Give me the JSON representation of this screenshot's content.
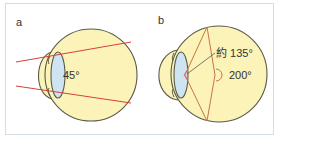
{
  "figure": {
    "panels": [
      {
        "id": "a",
        "label": "a",
        "angle_label": "45°"
      },
      {
        "id": "b",
        "label": "b",
        "angle_label_upper": "約 135°",
        "angle_label_lower": "200°"
      }
    ]
  },
  "colors": {
    "eyeball_fill": "#fbf3b8",
    "outline": "#5a5a4a",
    "lens_fill": "#cfe4f3",
    "ray_red": "#d8403a",
    "ray_brown": "#c9734a",
    "frame_border": "#d4dce6"
  }
}
